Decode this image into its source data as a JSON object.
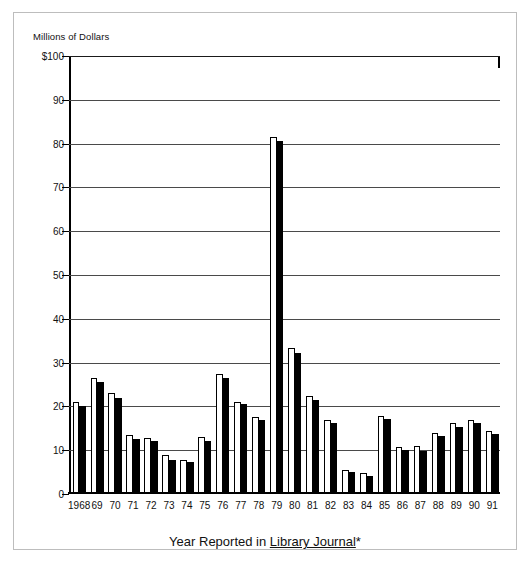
{
  "figure": {
    "y_axis_caption": "Millions of Dollars",
    "x_axis_title_prefix": "Year Reported in ",
    "x_axis_title_journal": "Library Journal",
    "x_axis_title_suffix": "*"
  },
  "chart_data": {
    "type": "bar",
    "title": "",
    "xlabel": "Year Reported in Library Journal*",
    "ylabel": "Millions of Dollars",
    "ylim": [
      0,
      100
    ],
    "yticks": [
      0,
      10,
      20,
      30,
      40,
      50,
      60,
      70,
      80,
      90,
      100
    ],
    "ytick_labels": [
      "0",
      "10",
      "20",
      "30",
      "40",
      "50",
      "60",
      "70",
      "80",
      "90",
      "$100"
    ],
    "grid": true,
    "legend": "none",
    "categories": [
      "1968",
      "69",
      "70",
      "71",
      "72",
      "73",
      "74",
      "75",
      "76",
      "77",
      "78",
      "79",
      "80",
      "81",
      "82",
      "83",
      "84",
      "85",
      "86",
      "87",
      "88",
      "89",
      "90",
      "91"
    ],
    "series": [
      {
        "name": "white",
        "color": "#ffffff",
        "values": [
          21.0,
          26.5,
          23.0,
          13.5,
          12.8,
          9.0,
          7.8,
          13.0,
          27.5,
          21.0,
          17.5,
          81.5,
          33.3,
          22.3,
          17.0,
          5.5,
          4.8,
          17.8,
          10.8,
          11.0,
          14.0,
          16.2,
          17.0,
          14.3
        ]
      },
      {
        "name": "black",
        "color": "#000000",
        "values": [
          20.0,
          25.5,
          22.0,
          12.5,
          12.2,
          7.8,
          7.2,
          12.0,
          26.5,
          20.5,
          17.0,
          80.5,
          32.2,
          21.5,
          16.2,
          5.0,
          4.0,
          17.2,
          10.0,
          9.8,
          13.3,
          15.3,
          16.3,
          13.6
        ]
      }
    ]
  }
}
